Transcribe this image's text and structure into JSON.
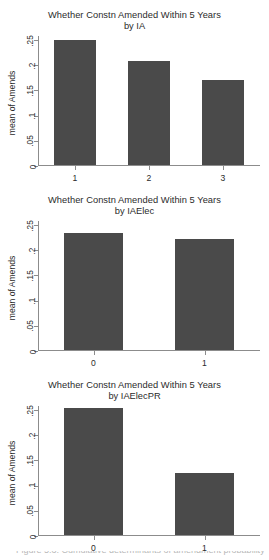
{
  "figure": {
    "width": 269,
    "height": 560,
    "background": "#ffffff",
    "bar_color": "#4a4a4a",
    "axis_color": "#8c8c8c",
    "caption_clipped": "Figure 5.3: Cumulative determinants of amendment probability"
  },
  "chart_data": [
    {
      "type": "bar",
      "title": "Whether Constn Amended Within 5 Years",
      "subtitle": "by IA",
      "xlabel": "",
      "ylabel": "mean of Amends",
      "categories": [
        "1",
        "2",
        "3"
      ],
      "values": [
        0.249,
        0.207,
        0.168
      ],
      "ylim": [
        0,
        0.25
      ],
      "yticks": [
        "0",
        ".05",
        ".1",
        ".15",
        ".2",
        ".25"
      ],
      "ytick_values": [
        0,
        0.05,
        0.1,
        0.15,
        0.2,
        0.25
      ],
      "grid": false,
      "legend": "none"
    },
    {
      "type": "bar",
      "title": "Whether Constn Amended Within 5 Years",
      "subtitle": "by IAElec",
      "xlabel": "",
      "ylabel": "mean of Amends",
      "categories": [
        "0",
        "1"
      ],
      "values": [
        0.233,
        0.22
      ],
      "ylim": [
        0,
        0.25
      ],
      "yticks": [
        "0",
        ".05",
        ".1",
        ".15",
        ".2",
        ".25"
      ],
      "ytick_values": [
        0,
        0.05,
        0.1,
        0.15,
        0.2,
        0.25
      ],
      "grid": false,
      "legend": "none"
    },
    {
      "type": "bar",
      "title": "Whether Constn Amended Within 5 Years",
      "subtitle": "by IAElecPR",
      "xlabel": "",
      "ylabel": "mean of Amends",
      "categories": [
        "0",
        "1"
      ],
      "values": [
        0.253,
        0.124
      ],
      "ylim": [
        0,
        0.25
      ],
      "yticks": [
        "0",
        ".05",
        ".1",
        ".15",
        ".2",
        ".25"
      ],
      "ytick_values": [
        0,
        0.05,
        0.1,
        0.15,
        0.2,
        0.25
      ],
      "grid": false,
      "legend": "none"
    }
  ]
}
